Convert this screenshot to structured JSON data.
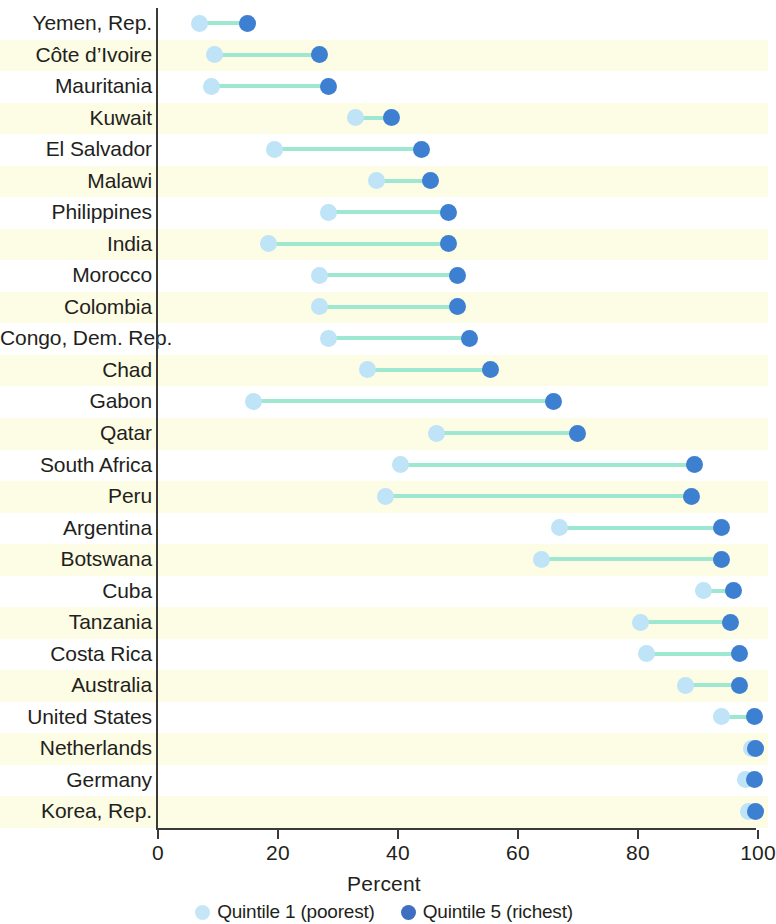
{
  "chart_data": {
    "type": "scatter",
    "subtype": "dumbbell",
    "title": "",
    "xlabel": "Percent",
    "ylabel": "",
    "xlim": [
      0,
      100
    ],
    "xticks": [
      0,
      20,
      40,
      60,
      80,
      100
    ],
    "xtick_labels": [
      "0",
      "20",
      "40",
      "60",
      "80",
      "100"
    ],
    "grid": false,
    "legend_position": "bottom",
    "series": [
      {
        "name": "Quintile 1 (poorest)",
        "color": "#bfe3f7"
      },
      {
        "name": "Quintile 5 (richest)",
        "color": "#3d7fd0"
      }
    ],
    "categories": [
      "Yemen, Rep.",
      "Côte d’Ivoire",
      "Mauritania",
      "Kuwait",
      "El Salvador",
      "Malawi",
      "Philippines",
      "India",
      "Morocco",
      "Colombia",
      "Congo, Dem. Rep.",
      "Chad",
      "Gabon",
      "Qatar",
      "South Africa",
      "Peru",
      "Argentina",
      "Botswana",
      "Cuba",
      "Tanzania",
      "Costa Rica",
      "Australia",
      "United States",
      "Netherlands",
      "Germany",
      "Korea, Rep."
    ],
    "rows": [
      {
        "label": "Yemen, Rep.",
        "q1": 7,
        "q5": 15
      },
      {
        "label": "Côte d’Ivoire",
        "q1": 9.5,
        "q5": 27
      },
      {
        "label": "Mauritania",
        "q1": 9,
        "q5": 28.5
      },
      {
        "label": "Kuwait",
        "q1": 33,
        "q5": 39
      },
      {
        "label": "El Salvador",
        "q1": 19.5,
        "q5": 44
      },
      {
        "label": "Malawi",
        "q1": 36.5,
        "q5": 45.5
      },
      {
        "label": "Philippines",
        "q1": 28.5,
        "q5": 48.5
      },
      {
        "label": "India",
        "q1": 18.5,
        "q5": 48.5
      },
      {
        "label": "Morocco",
        "q1": 27,
        "q5": 50
      },
      {
        "label": "Colombia",
        "q1": 27,
        "q5": 50
      },
      {
        "label": "Congo, Dem. Rep.",
        "q1": 28.5,
        "q5": 52
      },
      {
        "label": "Chad",
        "q1": 35,
        "q5": 55.5
      },
      {
        "label": "Gabon",
        "q1": 16,
        "q5": 66
      },
      {
        "label": "Qatar",
        "q1": 46.5,
        "q5": 70
      },
      {
        "label": "South Africa",
        "q1": 40.5,
        "q5": 89.5
      },
      {
        "label": "Peru",
        "q1": 38,
        "q5": 89
      },
      {
        "label": "Argentina",
        "q1": 67,
        "q5": 94
      },
      {
        "label": "Botswana",
        "q1": 64,
        "q5": 94
      },
      {
        "label": "Cuba",
        "q1": 91,
        "q5": 96
      },
      {
        "label": "Tanzania",
        "q1": 80.5,
        "q5": 95.5
      },
      {
        "label": "Costa Rica",
        "q1": 81.5,
        "q5": 97
      },
      {
        "label": "Australia",
        "q1": 88,
        "q5": 97
      },
      {
        "label": "United States",
        "q1": 94,
        "q5": 99.5
      },
      {
        "label": "Netherlands",
        "q1": 99,
        "q5": 99.8
      },
      {
        "label": "Germany",
        "q1": 98,
        "q5": 99.5
      },
      {
        "label": "Korea, Rep.",
        "q1": 98.5,
        "q5": 99.8
      }
    ]
  },
  "axis": {
    "x_title": "Percent",
    "ticks": [
      "0",
      "20",
      "40",
      "60",
      "80",
      "100"
    ]
  },
  "legend": {
    "items": [
      {
        "label": "Quintile 1 (poorest)",
        "swatch": "q1"
      },
      {
        "label": "Quintile 5 (richest)",
        "swatch": "q5"
      }
    ]
  },
  "colors": {
    "q1": "#bfe3f7",
    "q5": "#3d7fd0",
    "connector": "#9ee8d2",
    "band": "#fdfce4",
    "axis": "#3a3a38"
  }
}
